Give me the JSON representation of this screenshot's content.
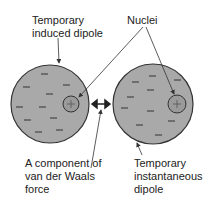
{
  "labels": {
    "induced_line1": "Temporary",
    "induced_line2": "induced dipole",
    "nuclei": "Nuclei",
    "force_line1": "A component of",
    "force_line2": "van der  Waals",
    "force_line3": "force",
    "instant_line1": "Temporary",
    "instant_line2": "instantaneous",
    "instant_line3": "dipole"
  },
  "symbols": {
    "electron": "−",
    "nucleus": "+"
  },
  "colors": {
    "atom_fill": "#a9a9a9",
    "nucleus_fill": "#9a9a9a",
    "stroke": "#333333"
  }
}
